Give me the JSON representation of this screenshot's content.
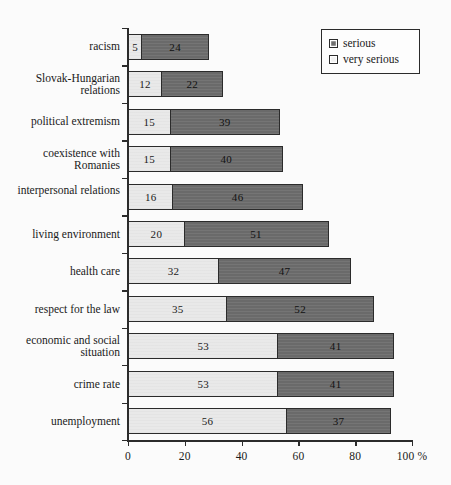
{
  "chart_data": {
    "type": "bar",
    "subtype": "stacked-horizontal",
    "title": "",
    "xlabel": "100 %",
    "ylabel": "",
    "xlim": [
      0,
      100
    ],
    "xticks": [
      0,
      20,
      40,
      60,
      80,
      100
    ],
    "xtick_labels": [
      "0",
      "20",
      "40",
      "60",
      "80",
      "100 %"
    ],
    "grid": false,
    "legend_position": "top-right",
    "categories": [
      "racism",
      "Slovak-Hungarian relations",
      "political extremism",
      "coexistence with Romanies",
      "interpersonal relations",
      "living environment",
      "health care",
      "respect for the law",
      "economic and social situation",
      "crime rate",
      "unemployment"
    ],
    "series": [
      {
        "name": "very serious",
        "color": "#e9e9e9",
        "values": [
          5,
          12,
          15,
          15,
          16,
          20,
          32,
          35,
          53,
          53,
          56
        ]
      },
      {
        "name": "serious",
        "color": "#6e6e6e",
        "values": [
          24,
          22,
          39,
          40,
          46,
          51,
          47,
          52,
          41,
          41,
          37
        ]
      }
    ]
  },
  "legend": {
    "items": [
      {
        "label": "serious",
        "swatch": "serious"
      },
      {
        "label": "very serious",
        "swatch": "very-serious"
      }
    ]
  },
  "axis": {
    "x_unit_suffix": "%"
  }
}
